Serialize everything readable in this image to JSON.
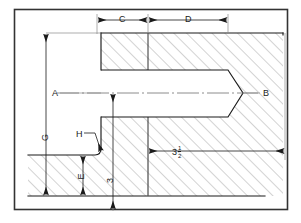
{
  "drawing": {
    "title": "Sectional assembly drawing of tapered plug in housing",
    "type": "engineering-section-view",
    "background_color": "#ffffff",
    "line_color": "#1a1a1a",
    "hatch_color": "#9a9a9a",
    "border": {
      "x": 14,
      "y": 9,
      "width": 274,
      "height": 201
    },
    "labels": [
      {
        "id": "dim-c",
        "text": "C",
        "x": 119,
        "y": 15,
        "rotated": false
      },
      {
        "id": "dim-d",
        "text": "D",
        "x": 185,
        "y": 15,
        "rotated": false
      },
      {
        "id": "ref-a",
        "text": "A",
        "x": 52,
        "y": 89,
        "rotated": false
      },
      {
        "id": "ref-b",
        "text": "B",
        "x": 263,
        "y": 89,
        "rotated": false
      },
      {
        "id": "ref-h",
        "text": "H",
        "x": 76,
        "y": 130,
        "rotated": false
      },
      {
        "id": "dim-g",
        "text": "G",
        "x": 42,
        "y": 133,
        "rotated": true
      },
      {
        "id": "dim-e",
        "text": "E",
        "x": 78,
        "y": 172,
        "rotated": true
      },
      {
        "id": "dim-3",
        "text": "3",
        "x": 108,
        "y": 176,
        "rotated": true
      }
    ],
    "fraction_label": {
      "id": "dim-three-and-half",
      "whole": "3",
      "numerator": "1",
      "denominator": "2",
      "x": 172,
      "y": 145
    },
    "dimension_lines": [
      {
        "name": "C",
        "orientation": "horizontal",
        "from": 97,
        "to": 148,
        "at": 20,
        "value": "C"
      },
      {
        "name": "D",
        "orientation": "horizontal",
        "from": 148,
        "to": 228,
        "at": 20,
        "value": "D"
      },
      {
        "name": "3 1/2",
        "orientation": "horizontal",
        "from": 148,
        "to": 285,
        "at": 151,
        "value": "3 1/2"
      },
      {
        "name": "G",
        "orientation": "vertical",
        "from": 33,
        "to": 196,
        "at": 46,
        "value": "G"
      },
      {
        "name": "E",
        "orientation": "vertical",
        "from": 155,
        "to": 196,
        "at": 83,
        "value": "E"
      },
      {
        "name": "3",
        "orientation": "vertical",
        "from": 93,
        "to": 210,
        "at": 113,
        "value": "3"
      }
    ],
    "geometry": {
      "centerline_y": 93,
      "plug_left_x": 101,
      "plug_top_y": 70,
      "plug_bottom_y": 117,
      "plug_shoulder_x": 228,
      "plug_tip_x": 243,
      "body_top_y": 33,
      "body_bottom_y": 196,
      "body_right_x": 283,
      "step_x": 148,
      "flange_top_y": 155,
      "flange_left_x": 28,
      "fillet_center": {
        "x": 100,
        "y": 152
      }
    }
  }
}
